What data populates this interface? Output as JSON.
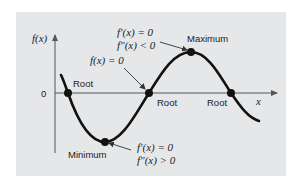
{
  "figure": {
    "y_axis_label": "f(x)",
    "x_axis_label": "x",
    "origin_label": "0",
    "colors": {
      "background": "#e6e7e9",
      "curve": "#111111",
      "axis": "#555555",
      "text": "#222222"
    }
  },
  "labels": {
    "root_1": "Root",
    "root_2": "Root",
    "root_3": "Root",
    "maximum": "Maximum",
    "minimum": "Minimum",
    "root_condition": "f(x) = 0",
    "max_condition_1": "f′(x) = 0",
    "max_condition_2": "f″(x) < 0",
    "min_condition_1": "f′(x) = 0",
    "min_condition_2": "f″(x) > 0"
  }
}
